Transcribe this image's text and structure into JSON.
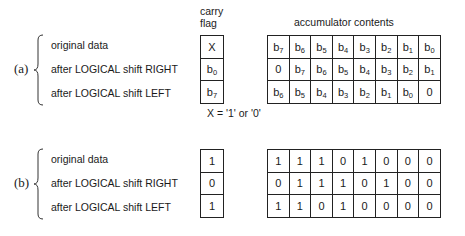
{
  "headers": {
    "carry_flag": "carry flag",
    "accumulator": "accumulator contents"
  },
  "row_labels": [
    "original data",
    "after LOGICAL shift RIGHT",
    "after LOGICAL shift LEFT"
  ],
  "note": "X = '1' or '0'",
  "sections": [
    {
      "label": "(a)",
      "carry": [
        {
          "base": "X",
          "sub": ""
        },
        {
          "base": "b",
          "sub": "0"
        },
        {
          "base": "b",
          "sub": "7"
        }
      ],
      "accumulator": [
        [
          {
            "base": "b",
            "sub": "7"
          },
          {
            "base": "b",
            "sub": "6"
          },
          {
            "base": "b",
            "sub": "5"
          },
          {
            "base": "b",
            "sub": "4"
          },
          {
            "base": "b",
            "sub": "3"
          },
          {
            "base": "b",
            "sub": "2"
          },
          {
            "base": "b",
            "sub": "1"
          },
          {
            "base": "b",
            "sub": "0"
          }
        ],
        [
          {
            "base": "0",
            "sub": ""
          },
          {
            "base": "b",
            "sub": "7"
          },
          {
            "base": "b",
            "sub": "6"
          },
          {
            "base": "b",
            "sub": "5"
          },
          {
            "base": "b",
            "sub": "4"
          },
          {
            "base": "b",
            "sub": "3"
          },
          {
            "base": "b",
            "sub": "2"
          },
          {
            "base": "b",
            "sub": "1"
          }
        ],
        [
          {
            "base": "b",
            "sub": "6"
          },
          {
            "base": "b",
            "sub": "5"
          },
          {
            "base": "b",
            "sub": "4"
          },
          {
            "base": "b",
            "sub": "3"
          },
          {
            "base": "b",
            "sub": "2"
          },
          {
            "base": "b",
            "sub": "1"
          },
          {
            "base": "b",
            "sub": "0"
          },
          {
            "base": "0",
            "sub": ""
          }
        ]
      ]
    },
    {
      "label": "(b)",
      "carry": [
        {
          "base": "1",
          "sub": ""
        },
        {
          "base": "0",
          "sub": ""
        },
        {
          "base": "1",
          "sub": ""
        }
      ],
      "accumulator": [
        [
          {
            "base": "1",
            "sub": ""
          },
          {
            "base": "1",
            "sub": ""
          },
          {
            "base": "1",
            "sub": ""
          },
          {
            "base": "0",
            "sub": ""
          },
          {
            "base": "1",
            "sub": ""
          },
          {
            "base": "0",
            "sub": ""
          },
          {
            "base": "0",
            "sub": ""
          },
          {
            "base": "0",
            "sub": ""
          }
        ],
        [
          {
            "base": "0",
            "sub": ""
          },
          {
            "base": "1",
            "sub": ""
          },
          {
            "base": "1",
            "sub": ""
          },
          {
            "base": "1",
            "sub": ""
          },
          {
            "base": "0",
            "sub": ""
          },
          {
            "base": "1",
            "sub": ""
          },
          {
            "base": "0",
            "sub": ""
          },
          {
            "base": "0",
            "sub": ""
          }
        ],
        [
          {
            "base": "1",
            "sub": ""
          },
          {
            "base": "1",
            "sub": ""
          },
          {
            "base": "0",
            "sub": ""
          },
          {
            "base": "1",
            "sub": ""
          },
          {
            "base": "0",
            "sub": ""
          },
          {
            "base": "0",
            "sub": ""
          },
          {
            "base": "0",
            "sub": ""
          },
          {
            "base": "0",
            "sub": ""
          }
        ]
      ]
    }
  ]
}
